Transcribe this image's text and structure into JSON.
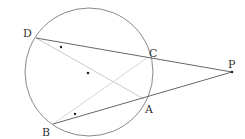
{
  "diagram": {
    "circle": {
      "cx": 89,
      "cy": 72,
      "r": 64,
      "stroke": "#7a7a7a"
    },
    "center_dot": {
      "x": 88,
      "y": 73
    },
    "points": {
      "D": {
        "x": 36,
        "y": 38,
        "label": "D",
        "lx": 23,
        "ly": 37
      },
      "C": {
        "x": 147,
        "y": 58,
        "label": "C",
        "lx": 149,
        "ly": 57
      },
      "P": {
        "x": 232,
        "y": 72,
        "label": "P",
        "lx": 228,
        "ly": 68
      },
      "A": {
        "x": 144,
        "y": 99,
        "label": "A",
        "lx": 145,
        "ly": 113
      },
      "B": {
        "x": 53,
        "y": 124,
        "label": "B",
        "lx": 42,
        "ly": 136
      }
    },
    "secants": [
      "DP",
      "BP"
    ],
    "chords": [
      "DA",
      "BC"
    ],
    "angle_marks": [
      {
        "x": 61,
        "y": 47,
        "symbol": "*"
      },
      {
        "x": 75,
        "y": 114,
        "symbol": "*"
      }
    ],
    "colors": {
      "line": "#555555",
      "chord": "#bbbbbb",
      "text": "#333333"
    }
  }
}
